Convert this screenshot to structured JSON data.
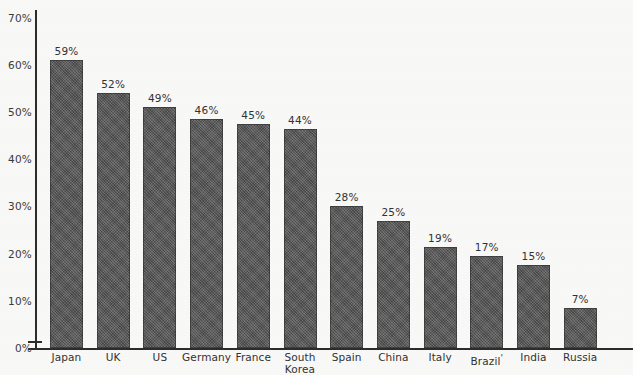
{
  "chart_data": {
    "type": "bar",
    "title": "",
    "subtitle": "",
    "xlabel": "",
    "ylabel": "",
    "ylim": [
      0,
      70
    ],
    "ytick_step": 10,
    "grid": false,
    "legend": null,
    "value_suffix": "%",
    "orientation": "vertical",
    "bar_color": "#585858",
    "axis_color": "#2d2d2d",
    "background_color": "#fdfdfc",
    "categories": [
      "Japan",
      "UK",
      "US",
      "Germany",
      "France",
      "South Korea",
      "Spain",
      "China",
      "Italy",
      "Brazil",
      "India",
      "Russia"
    ],
    "values": [
      59,
      52,
      49,
      46,
      45,
      44,
      28,
      25,
      19,
      17,
      15,
      7
    ],
    "value_labels": [
      "59%",
      "52%",
      "49%",
      "46%",
      "45%",
      "44%",
      "28%",
      "25%",
      "19%",
      "17%",
      "15%",
      "7%"
    ],
    "ytick_labels": [
      "70%",
      "60%",
      "50%",
      "40%",
      "30%",
      "20%",
      "10%",
      "0%"
    ],
    "ytick_values": [
      70,
      60,
      50,
      40,
      30,
      20,
      10,
      0
    ],
    "category_lines": [
      [
        "Japan"
      ],
      [
        "UK"
      ],
      [
        "US"
      ],
      [
        "Germany"
      ],
      [
        "France"
      ],
      [
        "South",
        "Korea"
      ],
      [
        "Spain"
      ],
      [
        "China"
      ],
      [
        "Italy"
      ],
      [
        "Brazil"
      ],
      [
        "India"
      ],
      [
        "Russia"
      ]
    ],
    "footnote_markers": [
      "",
      "",
      "",
      "",
      "",
      "",
      "",
      "",
      "",
      "'",
      "",
      ""
    ],
    "drawn_values": [
      61,
      54,
      51,
      48.5,
      47.5,
      46.5,
      30,
      27,
      21.5,
      19.5,
      17.5,
      8.5
    ]
  }
}
